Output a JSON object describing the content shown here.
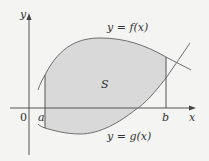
{
  "figure": {
    "type": "area-between-curves",
    "region_label": "S",
    "upper_curve_label": "y = f(x)",
    "lower_curve_label": "y = g(x)",
    "axes": {
      "x_label": "x",
      "y_label": "y",
      "origin_label": "0"
    },
    "bounds": {
      "left": "a",
      "right": "b"
    },
    "colors": {
      "background": "#f4f4f2",
      "region_fill": "#d9d9d9",
      "curve_stroke": "#6e6e6e",
      "axis_stroke": "#555555",
      "text": "#333333"
    }
  }
}
